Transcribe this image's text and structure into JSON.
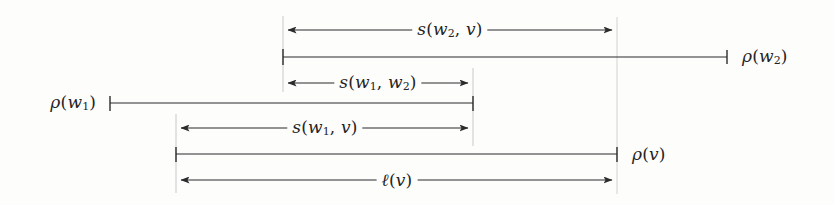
{
  "figure": {
    "kind": "interval-measurement-diagram",
    "width": 834,
    "height": 205,
    "background_color": "#fdfdfc",
    "line_color": "#2b2b2b",
    "guide_color": "#c9c9c9"
  },
  "labels": {
    "s_w2_v": "s(w2, v)",
    "rho_w2": "ρ(w2)",
    "s_w1_w2": "s(w1, w2)",
    "rho_w1": "ρ(w1)",
    "s_w1_v": "s(w1, v)",
    "rho_v": "ρ(v)",
    "ell_v": "ℓ(v)"
  },
  "rows": [
    {
      "name": "s-w2-v",
      "label": "s(w2, v)",
      "type": "double-arrow",
      "y": 30,
      "x_start": 283,
      "x_end": 617,
      "label_x": 450,
      "label_anchor": "center"
    },
    {
      "name": "rho-w2",
      "label": "ρ(w2)",
      "type": "tick-segment",
      "y": 57,
      "x_start": 283,
      "x_end": 727,
      "label_x": 737,
      "label_anchor": "left"
    },
    {
      "name": "s-w1-w2",
      "label": "s(w1, w2)",
      "type": "double-arrow",
      "y": 83,
      "x_start": 283,
      "x_end": 473,
      "label_x": 378,
      "label_anchor": "center"
    },
    {
      "name": "rho-w1",
      "label": "ρ(w1)",
      "type": "tick-segment",
      "y": 103,
      "x_start": 110,
      "x_end": 473,
      "label_x": 101,
      "label_anchor": "right"
    },
    {
      "name": "s-w1-v",
      "label": "s(w1, v)",
      "type": "double-arrow",
      "y": 128,
      "x_start": 176,
      "x_end": 473,
      "label_x": 325,
      "label_anchor": "center"
    },
    {
      "name": "rho-v",
      "label": "ρ(v)",
      "type": "tick-segment",
      "y": 154,
      "x_start": 176,
      "x_end": 617,
      "label_x": 627,
      "label_anchor": "left"
    },
    {
      "name": "ell-v",
      "label": "ℓ(v)",
      "type": "double-arrow",
      "y": 180,
      "x_start": 176,
      "x_end": 617,
      "label_x": 397,
      "label_anchor": "center"
    }
  ],
  "guides": [
    {
      "name": "guide-x176",
      "x": 176,
      "y_start": 114,
      "y_end": 193
    },
    {
      "name": "guide-x283",
      "x": 283,
      "y_start": 16,
      "y_end": 92
    },
    {
      "name": "guide-x473",
      "x": 473,
      "y_start": 68,
      "y_end": 146
    },
    {
      "name": "guide-x617",
      "x": 617,
      "y_start": 17,
      "y_end": 194
    }
  ]
}
